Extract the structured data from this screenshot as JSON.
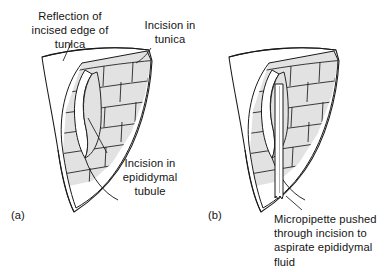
{
  "figure": {
    "type": "anatomical-line-diagram",
    "background_color": "#ffffff",
    "line_color": "#1a1a1a",
    "tubule_fill_color": "#e2e2e2",
    "tunica_fill_color": "#ffffff"
  },
  "panels": [
    {
      "id": "a",
      "label": "(a)",
      "description": "Tunica incised and reflected exposing epididymal tubule with incision"
    },
    {
      "id": "b",
      "label": "(b)",
      "description": "Micropipette inserted through the tubule incision"
    }
  ],
  "annotations": {
    "reflection": {
      "text": "Reflection of\nincised edge of\ntunica",
      "align": "center"
    },
    "incision_tunica": {
      "text": "Incision in\ntunica",
      "align": "center"
    },
    "incision_tubule": {
      "text": "Incision in\nepididymal\ntubule",
      "align": "center"
    },
    "micropipette": {
      "text": "Micropipette pushed\nthrough incision to\naspirate epididymal\nfluid",
      "align": "left"
    }
  }
}
